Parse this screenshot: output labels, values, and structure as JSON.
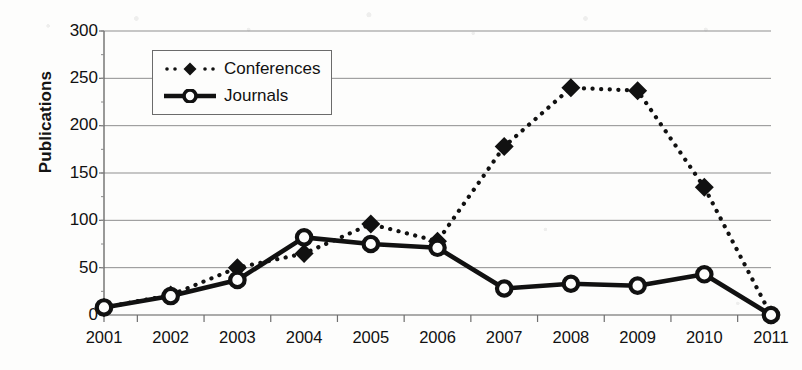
{
  "chart_data": {
    "type": "line",
    "title": "",
    "xlabel": "",
    "ylabel": "Publications",
    "categories": [
      "2001",
      "2002",
      "2003",
      "2004",
      "2005",
      "2006",
      "2007",
      "2008",
      "2009",
      "2010",
      "2011"
    ],
    "ylim": [
      0,
      300
    ],
    "yticks": [
      0,
      50,
      100,
      150,
      200,
      250,
      300
    ],
    "grid": true,
    "legend_position": "upper-left-inside",
    "series": [
      {
        "name": "Conferences",
        "style": "dotted",
        "marker": "diamond",
        "color": "#111111",
        "values": [
          8,
          21,
          50,
          65,
          96,
          78,
          178,
          240,
          237,
          135,
          0
        ]
      },
      {
        "name": "Journals",
        "style": "solid",
        "marker": "circle-open",
        "color": "#111111",
        "values": [
          8,
          20,
          37,
          82,
          75,
          71,
          28,
          33,
          31,
          43,
          0
        ]
      }
    ]
  },
  "axis": {
    "ytick_labels": [
      "300",
      "250",
      "200",
      "150",
      "100",
      "50",
      "0"
    ],
    "xtick_labels": [
      "2001",
      "2002",
      "2003",
      "2004",
      "2005",
      "2006",
      "2007",
      "2008",
      "2009",
      "2010",
      "2011"
    ],
    "ylabel_text": "Publications"
  },
  "legend": {
    "entries": [
      {
        "label": "Conferences",
        "marker": "diamond-marker-icon"
      },
      {
        "label": "Journals",
        "marker": "circle-marker-icon"
      }
    ]
  }
}
